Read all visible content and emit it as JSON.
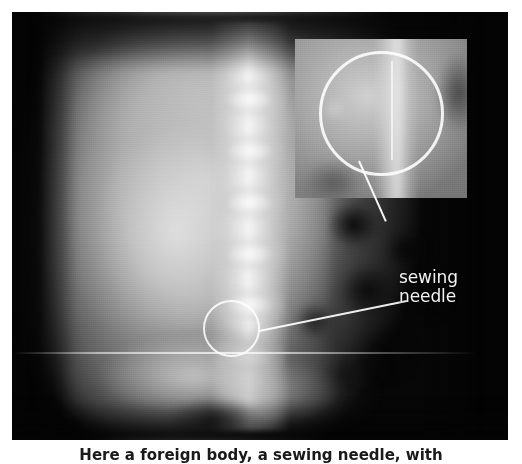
{
  "figure": {
    "modality": "abdominal radiograph",
    "view": "anteroposterior",
    "caption": "Here a foreign body, a sewing needle, with",
    "caption_note": "caption is cropped at the bottom edge of the image"
  },
  "annotation": {
    "line1": "sewing",
    "line2": "needle",
    "color": "#f2f2f2"
  },
  "markers": {
    "roi_circle": {
      "name": "region-of-interest-circle",
      "color": "#ffffff",
      "center_x": 219,
      "center_y": 316,
      "radius": 28
    },
    "leader_roi": {
      "name": "roi-leader-line",
      "color": "#ffffff"
    },
    "leader_inset": {
      "name": "inset-leader-line",
      "color": "#ffffff"
    }
  },
  "inset": {
    "name": "magnified-detail-panel",
    "x": 295,
    "y": 39,
    "width": 172,
    "height": 159,
    "circle": {
      "name": "inset-highlight-circle",
      "color": "#ffffff",
      "diameter": 125
    }
  },
  "plate": {
    "name": "radiograph-film",
    "x": 12,
    "y": 12,
    "width": 496,
    "height": 428,
    "background": "#060606",
    "scanline_y": 352
  },
  "page": {
    "background": "#ffffff",
    "width": 522,
    "height": 459
  }
}
